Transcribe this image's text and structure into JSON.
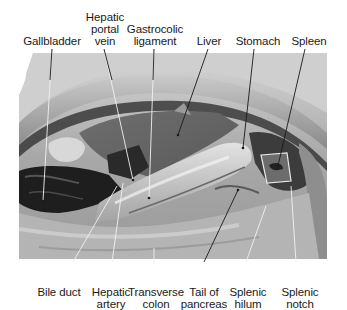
{
  "figure": {
    "type": "labeled anatomical photograph (grayscale)",
    "labels_top": [
      {
        "id": "gallbladder",
        "lines": [
          "Gallbladder"
        ]
      },
      {
        "id": "hepatic-portal-vein",
        "lines": [
          "Hepatic",
          "portal",
          "vein"
        ]
      },
      {
        "id": "gastrocolic-ligament",
        "lines": [
          "Gastrocolic",
          "ligament"
        ]
      },
      {
        "id": "liver",
        "lines": [
          "Liver"
        ]
      },
      {
        "id": "stomach",
        "lines": [
          "Stomach"
        ]
      },
      {
        "id": "spleen",
        "lines": [
          "Spleen"
        ]
      }
    ],
    "labels_bottom": [
      {
        "id": "bile-duct",
        "lines": [
          "Bile duct"
        ]
      },
      {
        "id": "hepatic-artery",
        "lines": [
          "Hepatic",
          "artery"
        ]
      },
      {
        "id": "transverse-colon",
        "lines": [
          "Transverse",
          "colon"
        ]
      },
      {
        "id": "tail-of-pancreas",
        "lines": [
          "Tail of",
          "pancreas"
        ]
      },
      {
        "id": "splenic-hilum",
        "lines": [
          "Splenic",
          "hilum"
        ]
      },
      {
        "id": "splenic-notch",
        "lines": [
          "Splenic",
          "notch"
        ]
      }
    ],
    "colors": {
      "background": "#ffffff",
      "label_text": "#1a1a1a",
      "leader_line_dark": "#1a1a1a",
      "leader_line_light": "#f0f0f0"
    }
  }
}
